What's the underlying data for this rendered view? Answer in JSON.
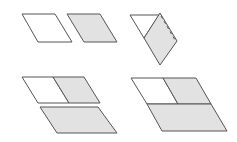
{
  "diagram": {
    "colors": {
      "stroke": "#555555",
      "white_fill": "#ffffff",
      "gray_fill": "#e2e2e2",
      "background": "#ffffff"
    },
    "panels": [
      {
        "id": "panel-1",
        "label": "Two separate parallelograms (white and gray)"
      },
      {
        "id": "panel-2",
        "label": "Folded parallelogram with dashed crease"
      },
      {
        "id": "panel-3",
        "label": "Two joined parallelograms above a larger gray parallelogram"
      },
      {
        "id": "panel-4",
        "label": "Combined large parallelogram"
      }
    ]
  }
}
